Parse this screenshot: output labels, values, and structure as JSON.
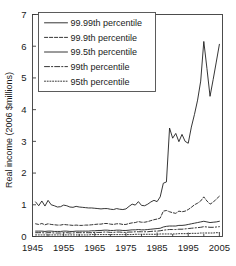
{
  "figure": {
    "name": "real-income-percentiles-chart"
  },
  "chart_data": {
    "type": "line",
    "title": "",
    "xlabel": "",
    "ylabel": "Real income (2006 $millions)",
    "xlim": [
      1945,
      2006
    ],
    "ylim": [
      0,
      7
    ],
    "xticks": [
      1945,
      1955,
      1965,
      1975,
      1985,
      1995,
      2005
    ],
    "xtick_labels": [
      "1945",
      "1955",
      "1965",
      "1975",
      "1985",
      "1995",
      "2005"
    ],
    "xminor_ticks": [
      1950,
      1960,
      1970,
      1980,
      1990,
      2000
    ],
    "yticks": [
      0,
      1,
      2,
      3,
      4,
      5,
      6,
      7
    ],
    "ytick_labels": [
      "0",
      "1",
      "2",
      "3",
      "4",
      "5",
      "6",
      "7"
    ],
    "grid": false,
    "legend_position": "upper-left",
    "x": [
      1946,
      1947,
      1948,
      1949,
      1950,
      1951,
      1952,
      1953,
      1954,
      1955,
      1956,
      1957,
      1958,
      1959,
      1960,
      1961,
      1962,
      1963,
      1964,
      1965,
      1966,
      1967,
      1968,
      1969,
      1970,
      1971,
      1972,
      1973,
      1974,
      1975,
      1976,
      1977,
      1978,
      1979,
      1980,
      1981,
      1982,
      1983,
      1984,
      1985,
      1986,
      1987,
      1988,
      1989,
      1990,
      1991,
      1992,
      1993,
      1994,
      1995,
      1996,
      1997,
      1998,
      1999,
      2000,
      2001,
      2002,
      2003,
      2004,
      2005
    ],
    "series": [
      {
        "name": "99.99th percentile",
        "style": "solid",
        "values": [
          1.09,
          0.97,
          1.12,
          0.96,
          1.14,
          1.0,
          0.97,
          0.93,
          0.94,
          0.99,
          0.97,
          0.93,
          0.92,
          0.95,
          0.93,
          0.92,
          0.91,
          0.9,
          0.9,
          0.89,
          0.88,
          0.87,
          0.88,
          0.88,
          0.86,
          0.85,
          0.88,
          0.86,
          0.85,
          0.87,
          0.95,
          1.02,
          0.99,
          1.1,
          0.98,
          0.97,
          1.02,
          1.09,
          1.14,
          1.1,
          1.25,
          1.68,
          1.72,
          3.42,
          3.1,
          3.25,
          2.99,
          3.22,
          3.0,
          2.94,
          3.45,
          3.85,
          4.3,
          4.9,
          6.15,
          5.3,
          4.42,
          4.95,
          5.5,
          6.06
        ]
      },
      {
        "name": "99.9th percentile",
        "style": "dashed",
        "values": [
          0.4,
          0.38,
          0.41,
          0.37,
          0.4,
          0.38,
          0.37,
          0.36,
          0.36,
          0.38,
          0.37,
          0.36,
          0.35,
          0.36,
          0.35,
          0.35,
          0.36,
          0.36,
          0.37,
          0.38,
          0.39,
          0.39,
          0.41,
          0.41,
          0.39,
          0.38,
          0.4,
          0.4,
          0.38,
          0.38,
          0.41,
          0.43,
          0.44,
          0.47,
          0.45,
          0.45,
          0.47,
          0.5,
          0.53,
          0.55,
          0.58,
          0.8,
          0.82,
          0.78,
          0.75,
          0.73,
          0.8,
          0.78,
          0.8,
          0.85,
          0.92,
          1.0,
          1.05,
          1.12,
          1.25,
          1.12,
          1.02,
          1.08,
          1.18,
          1.27
        ]
      },
      {
        "name": "99.5th percentile",
        "style": "solid",
        "values": [
          0.17,
          0.17,
          0.17,
          0.16,
          0.17,
          0.17,
          0.16,
          0.16,
          0.16,
          0.17,
          0.17,
          0.16,
          0.16,
          0.17,
          0.17,
          0.17,
          0.17,
          0.17,
          0.18,
          0.18,
          0.19,
          0.19,
          0.2,
          0.2,
          0.19,
          0.19,
          0.2,
          0.2,
          0.19,
          0.19,
          0.2,
          0.21,
          0.21,
          0.22,
          0.21,
          0.21,
          0.22,
          0.23,
          0.24,
          0.25,
          0.26,
          0.3,
          0.32,
          0.33,
          0.33,
          0.33,
          0.35,
          0.35,
          0.36,
          0.38,
          0.4,
          0.42,
          0.44,
          0.46,
          0.48,
          0.46,
          0.44,
          0.45,
          0.46,
          0.48
        ]
      },
      {
        "name": "99th percentile",
        "style": "dashdot",
        "values": [
          0.12,
          0.12,
          0.12,
          0.11,
          0.12,
          0.12,
          0.11,
          0.11,
          0.11,
          0.12,
          0.12,
          0.11,
          0.11,
          0.12,
          0.12,
          0.12,
          0.12,
          0.12,
          0.12,
          0.13,
          0.13,
          0.13,
          0.14,
          0.14,
          0.13,
          0.13,
          0.14,
          0.14,
          0.13,
          0.13,
          0.14,
          0.14,
          0.15,
          0.15,
          0.15,
          0.15,
          0.15,
          0.16,
          0.17,
          0.17,
          0.18,
          0.2,
          0.21,
          0.22,
          0.22,
          0.22,
          0.23,
          0.23,
          0.24,
          0.25,
          0.26,
          0.27,
          0.28,
          0.29,
          0.31,
          0.3,
          0.29,
          0.29,
          0.3,
          0.31
        ]
      },
      {
        "name": "95th percentile",
        "style": "dotted",
        "values": [
          0.05,
          0.05,
          0.05,
          0.05,
          0.05,
          0.05,
          0.05,
          0.05,
          0.05,
          0.05,
          0.05,
          0.05,
          0.05,
          0.05,
          0.05,
          0.05,
          0.05,
          0.05,
          0.06,
          0.06,
          0.06,
          0.06,
          0.06,
          0.06,
          0.06,
          0.06,
          0.06,
          0.06,
          0.06,
          0.06,
          0.06,
          0.06,
          0.07,
          0.07,
          0.07,
          0.07,
          0.07,
          0.07,
          0.07,
          0.07,
          0.08,
          0.08,
          0.08,
          0.08,
          0.08,
          0.08,
          0.09,
          0.09,
          0.09,
          0.09,
          0.1,
          0.1,
          0.1,
          0.11,
          0.11,
          0.11,
          0.11,
          0.11,
          0.12,
          0.12
        ]
      }
    ]
  },
  "legend": {
    "entries": [
      {
        "label": "99.99th percentile",
        "style": "solid"
      },
      {
        "label": "99.9th percentile",
        "style": "dashed"
      },
      {
        "label": "99.5th percentile",
        "style": "solid"
      },
      {
        "label": "99th percentile",
        "style": "dashdot"
      },
      {
        "label": "95th percentile",
        "style": "dotted"
      }
    ]
  },
  "colors": {
    "line": "#1f1f1f",
    "axis": "#3a3a3a",
    "text": "#1a1a1a",
    "background": "#ffffff"
  }
}
